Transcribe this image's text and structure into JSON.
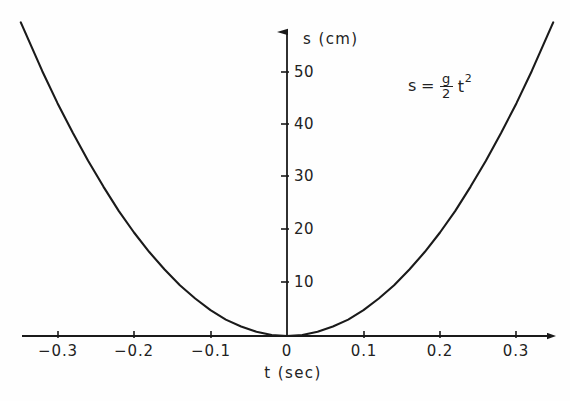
{
  "figure": {
    "background_color": "#fefefe",
    "line_color": "#1a1a1a"
  },
  "equation": {
    "lhs": "s",
    "equals": "=",
    "numerator": "g",
    "denominator": "2",
    "variable": "t",
    "exponent": "2",
    "plain": "s = g/2 t^2"
  },
  "chart_data": {
    "type": "line",
    "title": "",
    "subtitle": "",
    "xlabel": "t (sec)",
    "ylabel": "s (cm)",
    "xlim": [
      -0.348,
      0.348
    ],
    "ylim": [
      0,
      59
    ],
    "grid": false,
    "legend": null,
    "annotations": [
      {
        "text": "s = g/2 t^2",
        "x": 0.2,
        "y": 48
      }
    ],
    "axis_style": {
      "x_axis_at_y": 0,
      "y_axis_at_x": 0,
      "arrows": true,
      "ticks_inward": false
    },
    "xticks": [
      -0.3,
      -0.2,
      -0.1,
      0,
      0.1,
      0.2,
      0.3
    ],
    "xtick_labels": [
      "−0.3",
      "−0.2",
      "−0.1",
      "0",
      "0.1",
      "0.2",
      "0.3"
    ],
    "yticks": [
      10,
      20,
      30,
      40,
      50
    ],
    "ytick_labels": [
      "10",
      "20",
      "30",
      "40",
      "50"
    ],
    "series": [
      {
        "name": "s = g/2 t^2",
        "formula": "s = 490.5 * t^2",
        "x": [
          -0.348,
          -0.32,
          -0.3,
          -0.28,
          -0.26,
          -0.24,
          -0.22,
          -0.2,
          -0.18,
          -0.16,
          -0.14,
          -0.12,
          -0.1,
          -0.08,
          -0.06,
          -0.04,
          -0.02,
          0,
          0.02,
          0.04,
          0.06,
          0.08,
          0.1,
          0.12,
          0.14,
          0.16,
          0.18,
          0.2,
          0.22,
          0.24,
          0.26,
          0.28,
          0.3,
          0.32,
          0.348
        ],
        "y": [
          59.4,
          50.2,
          44.1,
          38.5,
          33.2,
          28.3,
          23.7,
          19.6,
          15.9,
          12.6,
          9.6,
          7.1,
          4.9,
          3.1,
          1.8,
          0.8,
          0.2,
          0,
          0.2,
          0.8,
          1.8,
          3.1,
          4.9,
          7.1,
          9.6,
          12.6,
          15.9,
          19.6,
          23.7,
          28.3,
          33.2,
          38.5,
          44.1,
          50.2,
          59.4
        ]
      }
    ]
  }
}
